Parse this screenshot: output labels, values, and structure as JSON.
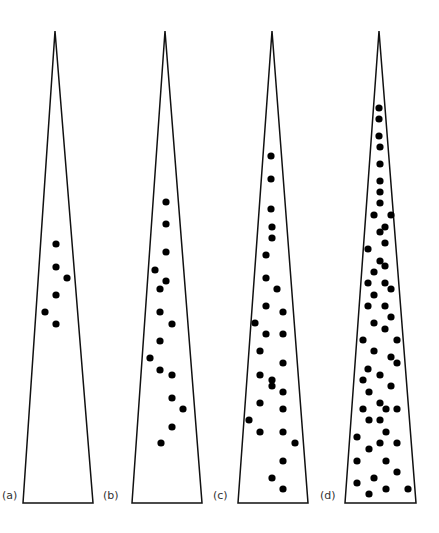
{
  "figure": {
    "stroke_color": "#111111",
    "dot_color": "#000000",
    "dot_radius": 3.6,
    "apex_y": 31,
    "base_y": 503,
    "panels": [
      {
        "label": "(a)",
        "label_pos": [
          2,
          489
        ],
        "apex_x": 55,
        "base_left": 23,
        "base_right": 93,
        "dots": [
          [
            56,
            244
          ],
          [
            56,
            267
          ],
          [
            67,
            278
          ],
          [
            56,
            295
          ],
          [
            45,
            312
          ],
          [
            56,
            324
          ]
        ]
      },
      {
        "label": "(b)",
        "label_pos": [
          103,
          489
        ],
        "apex_x": 165,
        "base_left": 132,
        "base_right": 202,
        "dots": [
          [
            166,
            202
          ],
          [
            166,
            224
          ],
          [
            166,
            252
          ],
          [
            155,
            270
          ],
          [
            166,
            281
          ],
          [
            160,
            289
          ],
          [
            160,
            312
          ],
          [
            172,
            324
          ],
          [
            160,
            341
          ],
          [
            150,
            358
          ],
          [
            160,
            370
          ],
          [
            172,
            375
          ],
          [
            172,
            398
          ],
          [
            183,
            409
          ],
          [
            172,
            427
          ],
          [
            161,
            443
          ]
        ]
      },
      {
        "label": "(c)",
        "label_pos": [
          213,
          489
        ],
        "apex_x": 272,
        "base_left": 238,
        "base_right": 308,
        "dots": [
          [
            271,
            156
          ],
          [
            271,
            179
          ],
          [
            271,
            209
          ],
          [
            272,
            227
          ],
          [
            272,
            238
          ],
          [
            266,
            255
          ],
          [
            266,
            278
          ],
          [
            277,
            289
          ],
          [
            266,
            306
          ],
          [
            283,
            312
          ],
          [
            255,
            323
          ],
          [
            266,
            334
          ],
          [
            283,
            334
          ],
          [
            260,
            351
          ],
          [
            283,
            363
          ],
          [
            260,
            375
          ],
          [
            272,
            380
          ],
          [
            272,
            386
          ],
          [
            283,
            392
          ],
          [
            260,
            403
          ],
          [
            283,
            409
          ],
          [
            249,
            420
          ],
          [
            260,
            432
          ],
          [
            283,
            432
          ],
          [
            295,
            443
          ],
          [
            283,
            461
          ],
          [
            272,
            478
          ],
          [
            283,
            489
          ]
        ]
      },
      {
        "label": "(d)",
        "label_pos": [
          320,
          489
        ],
        "apex_x": 379,
        "base_left": 345,
        "base_right": 416,
        "dots": [
          [
            379,
            108
          ],
          [
            379,
            119
          ],
          [
            379,
            136
          ],
          [
            380,
            147
          ],
          [
            380,
            164
          ],
          [
            380,
            181
          ],
          [
            380,
            192
          ],
          [
            380,
            203
          ],
          [
            374,
            215
          ],
          [
            391,
            215
          ],
          [
            385,
            227
          ],
          [
            380,
            232
          ],
          [
            385,
            243
          ],
          [
            368,
            249
          ],
          [
            380,
            261
          ],
          [
            385,
            266
          ],
          [
            374,
            272
          ],
          [
            368,
            283
          ],
          [
            385,
            283
          ],
          [
            391,
            289
          ],
          [
            374,
            295
          ],
          [
            368,
            306
          ],
          [
            385,
            306
          ],
          [
            391,
            317
          ],
          [
            374,
            323
          ],
          [
            385,
            329
          ],
          [
            363,
            340
          ],
          [
            397,
            340
          ],
          [
            374,
            351
          ],
          [
            391,
            357
          ],
          [
            397,
            363
          ],
          [
            368,
            369
          ],
          [
            380,
            375
          ],
          [
            363,
            380
          ],
          [
            391,
            386
          ],
          [
            369,
            392
          ],
          [
            380,
            403
          ],
          [
            363,
            409
          ],
          [
            386,
            409
          ],
          [
            397,
            409
          ],
          [
            369,
            420
          ],
          [
            380,
            420
          ],
          [
            386,
            432
          ],
          [
            357,
            437
          ],
          [
            380,
            443
          ],
          [
            397,
            443
          ],
          [
            369,
            449
          ],
          [
            357,
            461
          ],
          [
            386,
            461
          ],
          [
            397,
            472
          ],
          [
            374,
            478
          ],
          [
            357,
            483
          ],
          [
            386,
            489
          ],
          [
            408,
            489
          ],
          [
            369,
            494
          ]
        ]
      }
    ]
  }
}
